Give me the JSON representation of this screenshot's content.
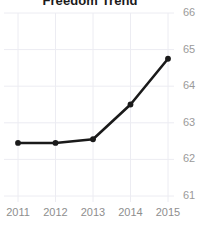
{
  "chart_data": {
    "type": "line",
    "title": "Freedom Trend",
    "xlabel": "",
    "ylabel": "",
    "x": [
      2011,
      2012,
      2013,
      2014,
      2015
    ],
    "categories": [
      "2011",
      "2012",
      "2013",
      "2014",
      "2015"
    ],
    "values": [
      62.45,
      62.45,
      62.55,
      63.5,
      64.75
    ],
    "series": [
      {
        "name": "Freedom Score",
        "values": [
          62.45,
          62.45,
          62.55,
          63.5,
          64.75
        ]
      }
    ],
    "xlim": [
      2011,
      2015
    ],
    "ylim": [
      61,
      66
    ],
    "ytick_labels": [
      "61",
      "62",
      "63",
      "64",
      "65",
      "66"
    ],
    "ytick_values": [
      61,
      62,
      63,
      64,
      65,
      66
    ],
    "xtick_labels": [
      "2011",
      "2012",
      "2013",
      "2014",
      "2015"
    ],
    "grid": true,
    "legend": false,
    "legend_position": "none",
    "line_color": "#1a1a1a",
    "marker_color": "#1a1a1a",
    "grid_color": "#ececf2",
    "tick_label_color": "#9a9a9a",
    "title_color": "#1a1a1a",
    "background_color": "#ffffff",
    "y_axis_side": "right",
    "annotations": []
  }
}
